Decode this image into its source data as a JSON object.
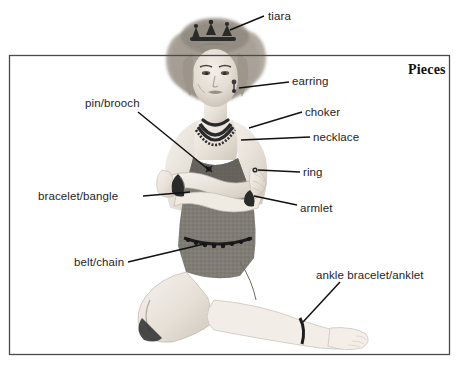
{
  "figure": {
    "heading": "Pieces",
    "frame_color": "#4a4a4a",
    "line_color": "#111111",
    "text_color": "#1e1e1e",
    "background": "#ffffff"
  },
  "labels": [
    {
      "id": "tiara",
      "text": "tiara",
      "x": 268,
      "y": 10,
      "anchor": "left"
    },
    {
      "id": "earring",
      "text": "earring",
      "x": 292,
      "y": 75,
      "anchor": "left"
    },
    {
      "id": "pin-brooch",
      "text": "pin/brooch",
      "x": 85,
      "y": 97,
      "anchor": "left"
    },
    {
      "id": "choker",
      "text": "choker",
      "x": 305,
      "y": 106,
      "anchor": "left"
    },
    {
      "id": "necklace",
      "text": "necklace",
      "x": 313,
      "y": 131,
      "anchor": "left"
    },
    {
      "id": "ring",
      "text": "ring",
      "x": 303,
      "y": 166,
      "anchor": "left"
    },
    {
      "id": "bracelet-bangle",
      "text": "bracelet/bangle",
      "x": 38,
      "y": 190,
      "anchor": "left"
    },
    {
      "id": "armlet",
      "text": "armlet",
      "x": 300,
      "y": 202,
      "anchor": "left"
    },
    {
      "id": "belt-chain",
      "text": "belt/chain",
      "x": 74,
      "y": 256,
      "anchor": "left"
    },
    {
      "id": "ankle-anklet",
      "text": "ankle bracelet/anklet",
      "x": 316,
      "y": 269,
      "anchor": "left"
    }
  ],
  "heading_pos": {
    "x": 408,
    "y": 62
  },
  "frame": {
    "x": 9,
    "y": 55,
    "width": 441,
    "height": 300
  }
}
